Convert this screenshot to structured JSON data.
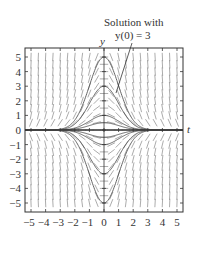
{
  "figure": {
    "annotation_line1": "Solution with",
    "annotation_line2": "y(0) = 3",
    "y_axis_label": "y",
    "x_axis_label": "t"
  },
  "chart_data": {
    "type": "slope_field",
    "equation_implied": "dy/dt = -t*y",
    "solution_family": "y = C*exp(-t^2/2)",
    "xlabel": "t",
    "ylabel": "y",
    "xlim": [
      -5.4,
      5.4
    ],
    "ylim": [
      -5.4,
      5.4
    ],
    "x_ticks": [
      -5,
      -4,
      -3,
      -2,
      -1,
      0,
      1,
      2,
      3,
      4,
      5
    ],
    "y_ticks": [
      -5,
      -4,
      -3,
      -2,
      -1,
      0,
      1,
      2,
      3,
      4,
      5
    ],
    "x_tick_labels": [
      "−5",
      "−4",
      "−3",
      "−2",
      "−1",
      "0",
      "1",
      "2",
      "3",
      "4",
      "5"
    ],
    "y_tick_labels": [
      "5",
      "4",
      "3",
      "2",
      "1",
      "0",
      "−1",
      "−2",
      "−3",
      "−4",
      "−5"
    ],
    "solution_curves_initial_values": [
      5,
      3,
      1,
      0.5,
      0,
      -0.5,
      -1,
      -3,
      -5
    ],
    "highlighted_solution": {
      "initial_value": 3,
      "label": "Solution with y(0) = 3"
    },
    "grid": false
  }
}
